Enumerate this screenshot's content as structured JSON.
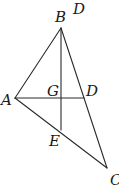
{
  "diagram": {
    "type": "geometry-triangle",
    "points": {
      "A": {
        "x": 15,
        "y": 98
      },
      "B": {
        "x": 61,
        "y": 28
      },
      "C": {
        "x": 107,
        "y": 168
      },
      "D": {
        "x": 84,
        "y": 98
      },
      "E": {
        "x": 61,
        "y": 130
      },
      "G": {
        "x": 61,
        "y": 98
      }
    },
    "segments": [
      [
        "A",
        "B"
      ],
      [
        "B",
        "C"
      ],
      [
        "A",
        "C"
      ],
      [
        "A",
        "D"
      ],
      [
        "B",
        "E"
      ]
    ],
    "labels": {
      "A": "A",
      "B": "B",
      "C": "C",
      "D": "D",
      "E": "E",
      "G": "G",
      "stray_D": "D"
    },
    "colors": {
      "line": "#2a2a2a",
      "text": "#1a1a1a",
      "background": "#ffffff"
    }
  }
}
